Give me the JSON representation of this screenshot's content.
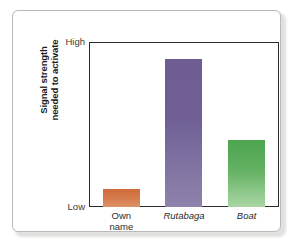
{
  "chart_data": {
    "type": "bar",
    "title": "",
    "subtitle": "",
    "xlabel": "",
    "ylabel_line1": "Signal strength",
    "ylabel_line2": "needed to activate",
    "categories": [
      "Own name",
      "Rutabaga",
      "Boat"
    ],
    "category_lines": [
      [
        "Own",
        "name"
      ],
      [
        "Rutabaga"
      ],
      [
        "Boat"
      ]
    ],
    "category_styles": [
      "normal",
      "italic",
      "italic"
    ],
    "values": [
      11,
      90,
      41
    ],
    "ylim": [
      0,
      100
    ],
    "ytick_labels": [
      "High",
      "Low"
    ],
    "ytick_values": [
      100,
      0
    ],
    "grid": false,
    "legend": "none",
    "bar_colors": [
      "#d2703f",
      "#6f5f94",
      "#55aa55"
    ],
    "series": [
      {
        "name": "Signal strength needed to activate",
        "values": [
          11,
          90,
          41
        ]
      }
    ]
  },
  "axes": {
    "y_title": {
      "line1": "Signal strength",
      "line2": "needed to activate"
    },
    "y_ticks": {
      "high": "High",
      "low": "Low"
    }
  },
  "colors": {
    "own_name_bar": "#d2703f",
    "rutabaga_bar": "#6f5f94",
    "boat_bar": "#55aa55",
    "frame": "#2b2b2b",
    "card_border": "#b9b9b7",
    "background": "#ffffff"
  }
}
